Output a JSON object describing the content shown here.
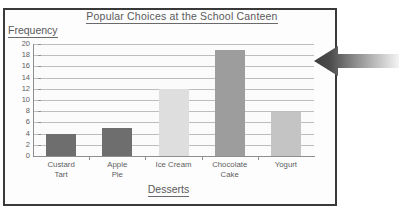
{
  "frame": {
    "border_color": "#3a3a3a",
    "background": "#fdfdfd"
  },
  "annotation": {
    "arrow_name": "left-pointing-arrow",
    "direction": "left",
    "color_dark": "#3d3d3d",
    "color_light": "#f2f2f2"
  },
  "chart_data": {
    "type": "bar",
    "title": "Popular Choices at the School Canteen",
    "xlabel": "Desserts",
    "ylabel": "Frequency",
    "categories": [
      "Custard\nTart",
      "Apple\nPie",
      "Ice Cream",
      "Chocolate\nCake",
      "Yogurt"
    ],
    "values": [
      4,
      5,
      12,
      19,
      7.8
    ],
    "bar_colors": [
      "#6e6e6e",
      "#6e6e6e",
      "#dedede",
      "#9d9d9d",
      "#c4c4c4"
    ],
    "ylim": [
      0,
      20
    ],
    "ytick_step": 2,
    "yticks": [
      0,
      2,
      4,
      6,
      8,
      10,
      12,
      14,
      16,
      18,
      20
    ],
    "ytick_labels": [
      "0",
      "2",
      "4",
      "6",
      "8",
      "10",
      "12",
      "14",
      "16",
      "18",
      "20"
    ],
    "grid": true,
    "grid_color": "#bdbdbd",
    "legend": null,
    "plot_background": "#fbfbfb",
    "axis_color": "#8e8e8e",
    "text_color": "#59595b"
  }
}
